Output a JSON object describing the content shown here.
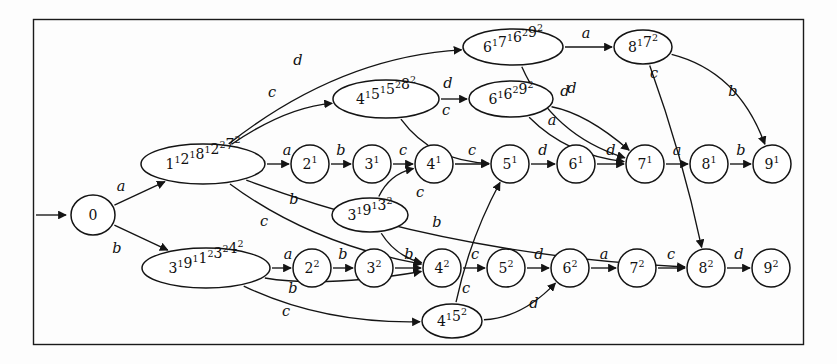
{
  "figure": {
    "kind": "finite-automaton-state-diagram",
    "border_color": "#1a1a1a",
    "node_stroke_color": "#141414",
    "edge_stroke_color": "#141414",
    "background_color": "#fdfdfd"
  },
  "start": {
    "marker_label": "",
    "target": "0"
  },
  "nodes": [
    {
      "id": "n0",
      "label": "0",
      "parts": [
        {
          "t": "0"
        }
      ],
      "shape": "circle",
      "cx": 93,
      "cy": 215,
      "rx": 22,
      "ry": 20
    },
    {
      "id": "n1a",
      "label": "1¹2¹8¹2²7²",
      "parts": [
        {
          "t": "1",
          "s": "1"
        },
        {
          "t": "2",
          "s": "1"
        },
        {
          "t": "8",
          "s": "1"
        },
        {
          "t": "2",
          "s": "2"
        },
        {
          "t": "7",
          "s": "2"
        }
      ],
      "shape": "ellipse",
      "cx": 203,
      "cy": 164,
      "rx": 62,
      "ry": 20
    },
    {
      "id": "n2_1",
      "label": "2¹",
      "parts": [
        {
          "t": "2",
          "s": "1"
        }
      ],
      "shape": "circle",
      "cx": 310,
      "cy": 164,
      "rx": 19,
      "ry": 19
    },
    {
      "id": "n3_1",
      "label": "3¹",
      "parts": [
        {
          "t": "3",
          "s": "1"
        }
      ],
      "shape": "circle",
      "cx": 372,
      "cy": 164,
      "rx": 19,
      "ry": 19
    },
    {
      "id": "n4_1",
      "label": "4¹",
      "parts": [
        {
          "t": "4",
          "s": "1"
        }
      ],
      "shape": "circle",
      "cx": 434,
      "cy": 164,
      "rx": 19,
      "ry": 19
    },
    {
      "id": "n5_1",
      "label": "5¹",
      "parts": [
        {
          "t": "5",
          "s": "1"
        }
      ],
      "shape": "circle",
      "cx": 510,
      "cy": 164,
      "rx": 19,
      "ry": 19
    },
    {
      "id": "n6_1",
      "label": "6¹",
      "parts": [
        {
          "t": "6",
          "s": "1"
        }
      ],
      "shape": "circle",
      "cx": 576,
      "cy": 164,
      "rx": 19,
      "ry": 19
    },
    {
      "id": "n7_1",
      "label": "7¹",
      "parts": [
        {
          "t": "7",
          "s": "1"
        }
      ],
      "shape": "circle",
      "cx": 645,
      "cy": 164,
      "rx": 19,
      "ry": 19
    },
    {
      "id": "n8_1",
      "label": "8¹",
      "parts": [
        {
          "t": "8",
          "s": "1"
        }
      ],
      "shape": "circle",
      "cx": 709,
      "cy": 164,
      "rx": 19,
      "ry": 19
    },
    {
      "id": "n9_1",
      "label": "9¹",
      "parts": [
        {
          "t": "9",
          "s": "1"
        }
      ],
      "shape": "circle",
      "cx": 772,
      "cy": 164,
      "rx": 19,
      "ry": 19
    },
    {
      "id": "n4151",
      "label": "4¹5¹5²8²",
      "parts": [
        {
          "t": "4",
          "s": "1"
        },
        {
          "t": "5",
          "s": "1"
        },
        {
          "t": "5",
          "s": "2"
        },
        {
          "t": "8",
          "s": "2"
        }
      ],
      "shape": "ellipse",
      "cx": 386,
      "cy": 99,
      "rx": 53,
      "ry": 19
    },
    {
      "id": "n616292",
      "label": "6¹6²9²",
      "parts": [
        {
          "t": "6",
          "s": "1"
        },
        {
          "t": "6",
          "s": "2"
        },
        {
          "t": "9",
          "s": "2"
        }
      ],
      "shape": "ellipse",
      "cx": 511,
      "cy": 99,
      "rx": 42,
      "ry": 18
    },
    {
      "id": "n61716292",
      "label": "6¹7¹6²9²",
      "parts": [
        {
          "t": "6",
          "s": "1"
        },
        {
          "t": "7",
          "s": "1"
        },
        {
          "t": "6",
          "s": "2"
        },
        {
          "t": "9",
          "s": "2"
        }
      ],
      "shape": "ellipse",
      "cx": 513,
      "cy": 47,
      "rx": 50,
      "ry": 18
    },
    {
      "id": "n8172",
      "label": "8¹7²",
      "parts": [
        {
          "t": "8",
          "s": "1"
        },
        {
          "t": "7",
          "s": "2"
        }
      ],
      "shape": "ellipse",
      "cx": 643,
      "cy": 47,
      "rx": 29,
      "ry": 17
    },
    {
      "id": "n319132",
      "label": "3¹9¹3²",
      "parts": [
        {
          "t": "3",
          "s": "1"
        },
        {
          "t": "9",
          "s": "1"
        },
        {
          "t": "3",
          "s": "2"
        }
      ],
      "shape": "ellipse",
      "cx": 370,
      "cy": 215,
      "rx": 38,
      "ry": 17
    },
    {
      "id": "n3191",
      "label": "3¹9¹1²3²4²",
      "parts": [
        {
          "t": "3",
          "s": "1"
        },
        {
          "t": "9",
          "s": "1"
        },
        {
          "t": "1",
          "s": "2"
        },
        {
          "t": "3",
          "s": "2"
        },
        {
          "t": "4",
          "s": "2"
        }
      ],
      "shape": "ellipse",
      "cx": 206,
      "cy": 268,
      "rx": 64,
      "ry": 20
    },
    {
      "id": "n2_2",
      "label": "2²",
      "parts": [
        {
          "t": "2",
          "s": "2"
        }
      ],
      "shape": "circle",
      "cx": 312,
      "cy": 268,
      "rx": 19,
      "ry": 19
    },
    {
      "id": "n3_2",
      "label": "3²",
      "parts": [
        {
          "t": "3",
          "s": "2"
        }
      ],
      "shape": "circle",
      "cx": 374,
      "cy": 268,
      "rx": 19,
      "ry": 19
    },
    {
      "id": "n4_2",
      "label": "4²",
      "parts": [
        {
          "t": "4",
          "s": "2"
        }
      ],
      "shape": "circle",
      "cx": 442,
      "cy": 268,
      "rx": 19,
      "ry": 19
    },
    {
      "id": "n5_2",
      "label": "5²",
      "parts": [
        {
          "t": "5",
          "s": "2"
        }
      ],
      "shape": "circle",
      "cx": 506,
      "cy": 268,
      "rx": 19,
      "ry": 19
    },
    {
      "id": "n6_2",
      "label": "6²",
      "parts": [
        {
          "t": "6",
          "s": "2"
        }
      ],
      "shape": "circle",
      "cx": 570,
      "cy": 268,
      "rx": 19,
      "ry": 19
    },
    {
      "id": "n7_2",
      "label": "7²",
      "parts": [
        {
          "t": "7",
          "s": "2"
        }
      ],
      "shape": "circle",
      "cx": 637,
      "cy": 268,
      "rx": 19,
      "ry": 19
    },
    {
      "id": "n8_2",
      "label": "8²",
      "parts": [
        {
          "t": "8",
          "s": "2"
        }
      ],
      "shape": "circle",
      "cx": 706,
      "cy": 268,
      "rx": 19,
      "ry": 19
    },
    {
      "id": "n9_2",
      "label": "9²",
      "parts": [
        {
          "t": "9",
          "s": "2"
        }
      ],
      "shape": "circle",
      "cx": 771,
      "cy": 268,
      "rx": 19,
      "ry": 19
    },
    {
      "id": "n4152",
      "label": "4¹5²",
      "parts": [
        {
          "t": "4",
          "s": "1"
        },
        {
          "t": "5",
          "s": "2"
        }
      ],
      "shape": "ellipse",
      "cx": 452,
      "cy": 321,
      "rx": 30,
      "ry": 17
    }
  ],
  "edges": [
    {
      "from": "n0",
      "to": "n1a",
      "label": "a",
      "lx": 121,
      "ly": 186
    },
    {
      "from": "n0",
      "to": "n3191",
      "label": "b",
      "lx": 117,
      "ly": 248
    },
    {
      "from": "n1a",
      "to": "n2_1",
      "label": "a",
      "lx": 287,
      "ly": 150
    },
    {
      "from": "n2_1",
      "to": "n3_1",
      "label": "b",
      "lx": 341,
      "ly": 150
    },
    {
      "from": "n3_1",
      "to": "n4_1",
      "label": "c",
      "lx": 403,
      "ly": 150
    },
    {
      "from": "n4_1",
      "to": "n5_1",
      "label": "c",
      "lx": 472,
      "ly": 150
    },
    {
      "from": "n5_1",
      "to": "n6_1",
      "label": "d",
      "lx": 543,
      "ly": 150
    },
    {
      "from": "n6_1",
      "to": "n7_1",
      "label": "d",
      "lx": 611,
      "ly": 150
    },
    {
      "from": "n7_1",
      "to": "n8_1",
      "label": "a",
      "lx": 677,
      "ly": 150
    },
    {
      "from": "n8_1",
      "to": "n9_1",
      "label": "b",
      "lx": 741,
      "ly": 150
    },
    {
      "from": "n1a",
      "to": "n61716292",
      "label": "d",
      "lx": 298,
      "ly": 60
    },
    {
      "from": "n1a",
      "to": "n4151",
      "label": "c",
      "lx": 272,
      "ly": 92
    },
    {
      "from": "n4151",
      "to": "n616292",
      "label": "d",
      "lx": 448,
      "ly": 83
    },
    {
      "from": "n4151",
      "to": "n5_1",
      "label": "c",
      "lx": 446,
      "ly": 110
    },
    {
      "from": "n61716292",
      "to": "n8172",
      "label": "a",
      "lx": 586,
      "ly": 33
    },
    {
      "from": "n61716292",
      "to": "n7_1",
      "label": "d",
      "lx": 572,
      "ly": 88
    },
    {
      "from": "n616292",
      "to": "n7_1",
      "label": "d",
      "lx": 565,
      "ly": 91
    },
    {
      "from": "n616292",
      "to": "n7_1",
      "label": "a",
      "lx": 552,
      "ly": 120
    },
    {
      "from": "n8172",
      "to": "n9_1",
      "label": "b",
      "lx": 733,
      "ly": 91
    },
    {
      "from": "n8172",
      "to": "n8_2",
      "label": "c",
      "lx": 654,
      "ly": 73
    },
    {
      "from": "n1a",
      "to": "n4_2",
      "label": "b",
      "lx": 294,
      "ly": 199
    },
    {
      "from": "n1a",
      "to": "n8_2",
      "label": "c",
      "lx": 264,
      "ly": 221
    },
    {
      "from": "n319132",
      "to": "n4_1",
      "label": "c",
      "lx": 420,
      "ly": 192
    },
    {
      "from": "n319132",
      "to": "n4_2",
      "label": "b",
      "lx": 437,
      "ly": 222
    },
    {
      "from": "n3191",
      "to": "n2_2",
      "label": "a",
      "lx": 288,
      "ly": 254
    },
    {
      "from": "n2_2",
      "to": "n3_2",
      "label": "b",
      "lx": 343,
      "ly": 254
    },
    {
      "from": "n3_2",
      "to": "n4_2",
      "label": "b",
      "lx": 409,
      "ly": 254
    },
    {
      "from": "n4_2",
      "to": "n5_2",
      "label": "c",
      "lx": 475,
      "ly": 254
    },
    {
      "from": "n5_2",
      "to": "n6_2",
      "label": "d",
      "lx": 539,
      "ly": 254
    },
    {
      "from": "n6_2",
      "to": "n7_2",
      "label": "a",
      "lx": 604,
      "ly": 254
    },
    {
      "from": "n7_2",
      "to": "n8_2",
      "label": "c",
      "lx": 671,
      "ly": 254
    },
    {
      "from": "n8_2",
      "to": "n9_2",
      "label": "d",
      "lx": 739,
      "ly": 254
    },
    {
      "from": "n3191",
      "to": "n4_2",
      "label": "b",
      "lx": 293,
      "ly": 288
    },
    {
      "from": "n3191",
      "to": "n4152",
      "label": "c",
      "lx": 286,
      "ly": 311
    },
    {
      "from": "n4152",
      "to": "n5_1",
      "label": "c",
      "lx": 466,
      "ly": 288
    },
    {
      "from": "n4152",
      "to": "n6_2",
      "label": "d",
      "lx": 534,
      "ly": 303
    }
  ],
  "alphabet": [
    "a",
    "b",
    "c",
    "d"
  ]
}
